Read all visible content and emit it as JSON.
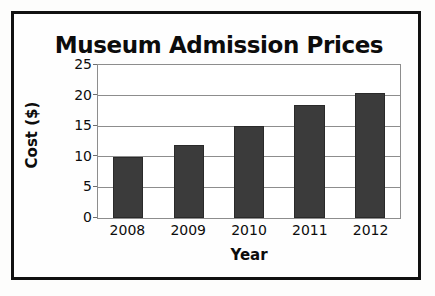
{
  "chart_data": {
    "type": "bar",
    "title": "Museum Admission Prices",
    "xlabel": "Year",
    "ylabel": "Cost ($)",
    "categories": [
      "2008",
      "2009",
      "2010",
      "2011",
      "2012"
    ],
    "values": [
      10,
      12,
      15,
      18.5,
      20.5
    ],
    "ylim": [
      0,
      25
    ],
    "yticks": [
      0,
      5,
      10,
      15,
      20,
      25
    ],
    "ytick_labels": [
      "0",
      "5",
      "10",
      "15",
      "20",
      "25"
    ],
    "grid": true,
    "grid_axis": "y",
    "legend": null,
    "legend_position": "none",
    "bar_color": "#3b3b3b",
    "plot_border_color": "#8d8d8d",
    "frame_color": "#111111",
    "background_color": "#ffffff",
    "text_color": "#0c0c0c"
  }
}
